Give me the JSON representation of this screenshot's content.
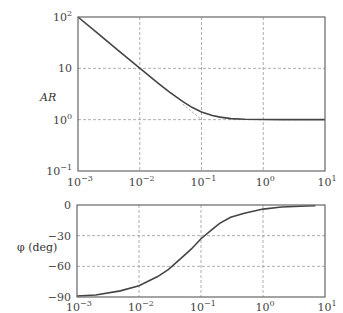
{
  "chart_data": [
    {
      "type": "line",
      "title": "",
      "xlabel": "",
      "ylabel": "AR",
      "xscale": "log",
      "yscale": "log",
      "xlim": [
        0.001,
        10
      ],
      "ylim": [
        0.1,
        100
      ],
      "grid": true,
      "x_tick_labels": [
        "10^-3",
        "10^-2",
        "10^-1",
        "10^0",
        "10^1"
      ],
      "y_tick_labels": [
        "10^2",
        "10",
        "10^0",
        "10^-1"
      ],
      "series": [
        {
          "name": "AR",
          "x": [
            0.001,
            0.002,
            0.005,
            0.01,
            0.02,
            0.03,
            0.05,
            0.07,
            0.1,
            0.15,
            0.2,
            0.3,
            0.5,
            1,
            2,
            5,
            10
          ],
          "y": [
            100,
            50,
            20,
            10.05,
            5.1,
            3.48,
            2.24,
            1.74,
            1.41,
            1.2,
            1.12,
            1.05,
            1.02,
            1.005,
            1.0,
            1.0,
            1.0
          ]
        }
      ],
      "asymptote_note": "faint dashed low-frequency asymptote segment near corner frequency 10^-1"
    },
    {
      "type": "line",
      "title": "",
      "xlabel": "",
      "ylabel": "φ (deg)",
      "xscale": "log",
      "yscale": "linear",
      "xlim": [
        0.001,
        10
      ],
      "ylim": [
        -90,
        0
      ],
      "grid": true,
      "x_tick_labels": [
        "10^-3",
        "10^-2",
        "10^-1",
        "10^0",
        "10^1"
      ],
      "y_tick_labels": [
        "0",
        "−30",
        "−60",
        "−90"
      ],
      "series": [
        {
          "name": "phase",
          "x": [
            0.001,
            0.002,
            0.005,
            0.01,
            0.02,
            0.03,
            0.05,
            0.07,
            0.1,
            0.15,
            0.2,
            0.3,
            0.5,
            1,
            2,
            5,
            7
          ],
          "y": [
            -89,
            -88,
            -84,
            -79,
            -70,
            -63,
            -51,
            -43,
            -33,
            -24,
            -18,
            -12,
            -8,
            -4,
            -2,
            -1,
            -0.8
          ]
        }
      ]
    }
  ],
  "labels": {
    "top_ylabel": "AR",
    "bottom_ylabel": "φ (deg)",
    "top_yticks": [
      {
        "base": "10",
        "exp": "2"
      },
      {
        "base": "10",
        "exp": ""
      },
      {
        "base": "10",
        "exp": "0"
      },
      {
        "base": "10",
        "exp": "−1"
      }
    ],
    "xticks": [
      {
        "base": "10",
        "exp": "−3"
      },
      {
        "base": "10",
        "exp": "−2"
      },
      {
        "base": "10",
        "exp": "−1"
      },
      {
        "base": "10",
        "exp": "0"
      },
      {
        "base": "10",
        "exp": "1"
      }
    ],
    "bottom_yticks": [
      "0",
      "−30",
      "−60",
      "−90"
    ]
  }
}
